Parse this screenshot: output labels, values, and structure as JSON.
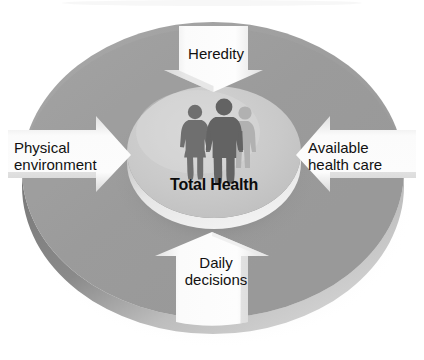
{
  "diagram": {
    "type": "circular-influence-diagram",
    "center": {
      "label": "Total Health",
      "icon": "three-people-silhouette-icon"
    },
    "arrows": [
      {
        "id": "heredity",
        "label": "Heredity",
        "lines": [
          "Heredity"
        ],
        "direction": "down",
        "position": "top",
        "icon": "arrow-down-icon"
      },
      {
        "id": "physical-environment",
        "label": "Physical environment",
        "lines": [
          "Physical",
          "environment"
        ],
        "direction": "right",
        "position": "left",
        "icon": "arrow-right-icon"
      },
      {
        "id": "available-health-care",
        "label": "Available health care",
        "lines": [
          "Available",
          "health care"
        ],
        "direction": "left",
        "position": "right",
        "icon": "arrow-left-icon"
      },
      {
        "id": "daily-decisions",
        "label": "Daily decisions",
        "lines": [
          "Daily",
          "decisions"
        ],
        "direction": "up",
        "position": "bottom",
        "icon": "arrow-up-icon"
      }
    ],
    "colors": {
      "background": "#ffffff",
      "ring_top": "#a3a3a3",
      "ring_body": "#9b9b9b",
      "ring_rim_dark": "#7c7c7c",
      "ring_rim_light": "#cfcfcf",
      "inner_disc": "#c8c8c8",
      "inner_disc_edge": "#e8e8e8",
      "arrow_light": "#f6f6f6",
      "arrow_shade": "#d0d0d0",
      "figure_dark": "#6e6e6e",
      "figure_light": "#a9a9a9",
      "text": "#111111"
    }
  }
}
